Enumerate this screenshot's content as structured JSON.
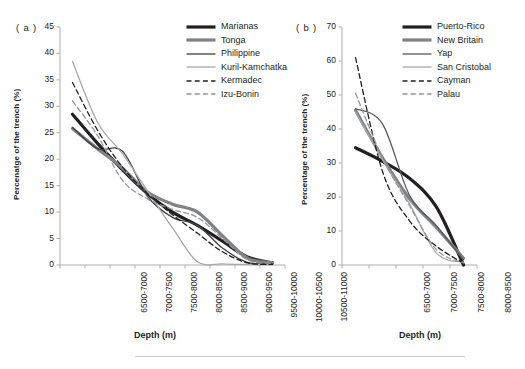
{
  "figure": {
    "background": "#ffffff",
    "caption_rule": true
  },
  "panels": [
    {
      "id": "a",
      "label": "( a )",
      "chart_data": {
        "type": "line",
        "title": "",
        "xlabel": "Depth (m)",
        "ylabel": "Percenatge of the trench (%)",
        "ylim": [
          0,
          45
        ],
        "yticks": [
          0,
          5,
          10,
          15,
          20,
          25,
          30,
          35,
          40,
          45
        ],
        "grid": false,
        "legend_position": "top-right",
        "categories": [
          "6500-7000",
          "7000-7500",
          "7500-8000",
          "8000-8500",
          "8500-9000",
          "9000-9500",
          "9500-10000",
          "10000-10500",
          "10500-11000"
        ],
        "series": [
          {
            "name": "Marianas",
            "color": "#231f20",
            "width": 3.2,
            "dash": "none",
            "values": [
              28.5,
              23.0,
              18.0,
              13.5,
              10.0,
              7.5,
              4.5,
              1.5,
              0.4
            ]
          },
          {
            "name": "Tonga",
            "color": "#808285",
            "width": 3.2,
            "dash": "none",
            "values": [
              25.8,
              22.0,
              18.3,
              13.8,
              11.5,
              10.0,
              5.5,
              1.3,
              0.4
            ]
          },
          {
            "name": "Philippine",
            "color": "#414042",
            "width": 1.3,
            "dash": "none",
            "values": [
              26.0,
              22.0,
              21.5,
              13.0,
              9.0,
              7.5,
              3.2,
              0.5,
              0.2
            ]
          },
          {
            "name": "Kuril-Kamchatka",
            "color": "#a7a9ac",
            "width": 1.3,
            "dash": "none",
            "values": [
              38.5,
              27.0,
              21.0,
              14.0,
              7.0,
              0.6,
              0.2,
              0.1,
              0.05
            ]
          },
          {
            "name": "Kermadec",
            "color": "#231f20",
            "width": 1.3,
            "dash": "dashed",
            "values": [
              34.5,
              25.5,
              18.5,
              13.5,
              9.5,
              6.0,
              2.5,
              0.4,
              0.1
            ]
          },
          {
            "name": "Izu-Bonin",
            "color": "#939598",
            "width": 1.3,
            "dash": "dashed",
            "values": [
              31.0,
              24.5,
              16.0,
              12.5,
              10.5,
              9.0,
              5.0,
              1.0,
              0.3
            ]
          }
        ]
      }
    },
    {
      "id": "b",
      "label": "( b )",
      "chart_data": {
        "type": "line",
        "title": "",
        "xlabel": "Depth (m)",
        "ylabel": "Percentage of the trench (%)",
        "ylim": [
          0,
          70
        ],
        "yticks": [
          0,
          10,
          20,
          30,
          40,
          50,
          60,
          70
        ],
        "grid": false,
        "legend_position": "top-right",
        "categories": [
          "6500-7000",
          "7000-7500",
          "7500-8000",
          "8000-8500",
          "8500-9000"
        ],
        "series": [
          {
            "name": "Puerto-Rico",
            "color": "#231f20",
            "width": 3.2,
            "dash": "none",
            "values": [
              34.5,
              30.5,
              25.5,
              17.0,
              0.0
            ]
          },
          {
            "name": "New Britain",
            "color": "#808285",
            "width": 3.2,
            "dash": "none",
            "values": [
              45.5,
              31.5,
              19.5,
              11.0,
              2.0
            ]
          },
          {
            "name": "Yap",
            "color": "#58595b",
            "width": 1.3,
            "dash": "none",
            "values": [
              46.0,
              41.5,
              20.5,
              11.5,
              1.5
            ]
          },
          {
            "name": "San Cristobal",
            "color": "#a7a9ac",
            "width": 1.3,
            "dash": "none",
            "values": [
              45.0,
              31.0,
              18.0,
              3.5,
              0.8
            ]
          },
          {
            "name": "Cayman",
            "color": "#231f20",
            "width": 1.3,
            "dash": "dashed",
            "values": [
              61.0,
              27.5,
              13.0,
              5.5,
              0.5
            ]
          },
          {
            "name": "Palau",
            "color": "#939598",
            "width": 1.3,
            "dash": "dashed",
            "values": [
              50.5,
              31.5,
              17.5,
              4.5,
              0.6
            ]
          }
        ]
      }
    }
  ]
}
